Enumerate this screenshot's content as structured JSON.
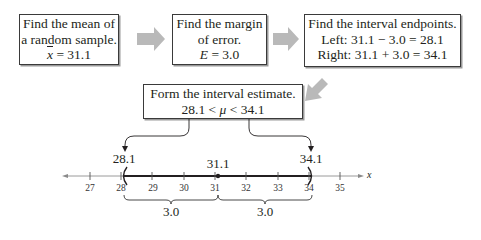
{
  "steps": [
    {
      "lines": [
        "Find the mean of",
        "a random sample.",
        "x̄ = 31.1"
      ]
    },
    {
      "lines": [
        "Find the margin",
        "of error.",
        "E = 3.0"
      ]
    },
    {
      "lines": [
        "Find the interval endpoints.",
        "Left: 31.1 − 3.0 = 28.1",
        "Right: 31.1 + 3.0 = 34.1"
      ]
    },
    {
      "lines": [
        "Form the interval estimate.",
        "28.1 < μ < 34.1"
      ]
    }
  ],
  "number_line": {
    "axis_label": "x",
    "ticks": [
      "27",
      "28",
      "29",
      "30",
      "31",
      "32",
      "33",
      "34",
      "35"
    ],
    "left_endpoint": "28.1",
    "center": "31.1",
    "right_endpoint": "34.1",
    "left_brace": "3.0",
    "right_brace": "3.0"
  },
  "colors": {
    "arrow": "#b8b8b8",
    "line": "#231f20",
    "axis_light": "#9a9a9a"
  }
}
